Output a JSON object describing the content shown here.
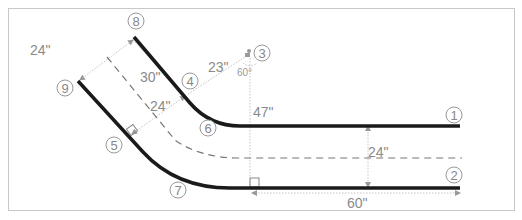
{
  "diagram": {
    "callouts": [
      {
        "id": "1",
        "label": "1"
      },
      {
        "id": "2",
        "label": "2"
      },
      {
        "id": "3",
        "label": "3"
      },
      {
        "id": "4",
        "label": "4"
      },
      {
        "id": "5",
        "label": "5"
      },
      {
        "id": "6",
        "label": "6"
      },
      {
        "id": "7",
        "label": "7"
      },
      {
        "id": "8",
        "label": "8"
      },
      {
        "id": "9",
        "label": "9"
      }
    ],
    "dimensions": {
      "top_width": "24\"",
      "diag_length": "30\"",
      "mid_width": "24\"",
      "radius": "23\"",
      "angle": "60°",
      "vertical": "47\"",
      "right_width": "24\"",
      "straight_length": "60\""
    },
    "colors": {
      "wall": "#1a1a1a",
      "dimension": "#b0b0b0",
      "centerline": "#777777",
      "frame": "#c8c8c8",
      "text": "#8a8a8a"
    }
  }
}
